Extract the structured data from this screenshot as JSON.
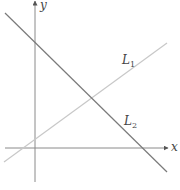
{
  "diagram": {
    "type": "coordinate-plane-lines",
    "axes": {
      "x_label": "x",
      "y_label": "y",
      "color": "#8a8a8a"
    },
    "lines": [
      {
        "name": "L1",
        "label_main": "L",
        "label_sub": "1",
        "color": "#c8c8c8",
        "slope_sign": "positive"
      },
      {
        "name": "L2",
        "label_main": "L",
        "label_sub": "2",
        "color": "#7a7a7a",
        "slope_sign": "negative"
      }
    ]
  }
}
